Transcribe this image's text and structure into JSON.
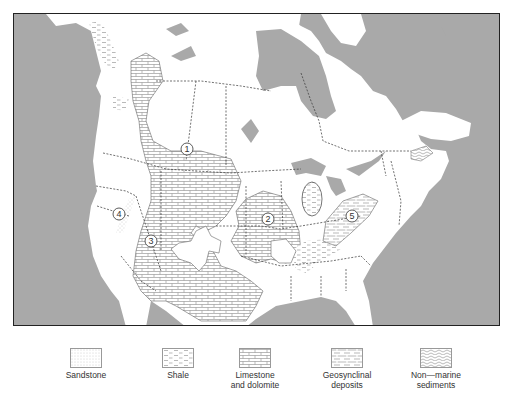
{
  "map": {
    "title": "North America sedimentary deposit map",
    "colors": {
      "ocean": "#a9a9a9",
      "land": "#ffffff",
      "border": "#333333",
      "pattern": "#8a8a8a"
    },
    "regions": [
      {
        "id": "1",
        "label": "1",
        "x": 186,
        "y": 148
      },
      {
        "id": "2",
        "label": "2",
        "x": 267,
        "y": 218
      },
      {
        "id": "3",
        "label": "3",
        "x": 150,
        "y": 240
      },
      {
        "id": "4",
        "label": "4",
        "x": 118,
        "y": 213
      },
      {
        "id": "5",
        "label": "5",
        "x": 351,
        "y": 215
      }
    ]
  },
  "legend": {
    "items": [
      {
        "key": "sandstone",
        "label": "Sandstone"
      },
      {
        "key": "shale",
        "label": "Shale"
      },
      {
        "key": "limestone",
        "label": "Limestone\nand dolomite"
      },
      {
        "key": "geosynclinal",
        "label": "Geosynclinal\ndeposits"
      },
      {
        "key": "nonmarine",
        "label": "Non—marine\nsediments"
      }
    ]
  }
}
